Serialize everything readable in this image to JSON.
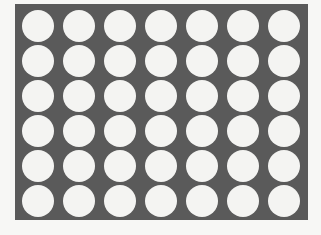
{
  "grid": {
    "rows": 6,
    "columns": 7,
    "background_color": "#5a5a5a",
    "circle_color": "#f4f4f2",
    "page_color": "#f7f7f5"
  }
}
